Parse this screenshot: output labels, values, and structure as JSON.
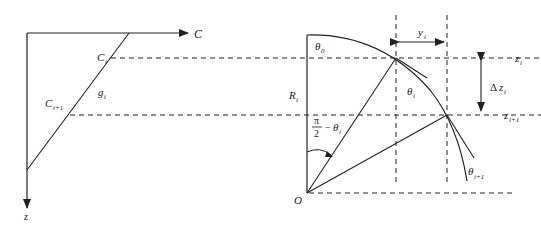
{
  "left_panel": {
    "axis_horizontal_label": "C",
    "axis_vertical_label": "z",
    "point_upper": {
      "main": "C",
      "sub": "i"
    },
    "point_lower": {
      "main": "C",
      "sub": "i+1"
    },
    "gradient_label": {
      "main": "g",
      "sub": "i"
    }
  },
  "right_panel": {
    "origin_label": "O",
    "initial_angle": {
      "main": "θ",
      "sub": "0"
    },
    "radius_label": {
      "main": "R",
      "sub": "i"
    },
    "angle_fraction": {
      "numerator": "π",
      "denominator": "2",
      "minus": "−",
      "theta": "θ",
      "sub": "i"
    },
    "theta_i": {
      "main": "θ",
      "sub": "i"
    },
    "theta_i1": {
      "main": "θ",
      "sub": "i+1"
    },
    "horizontal_offset": {
      "main": "y",
      "sub": "i"
    },
    "depth_step": {
      "delta": "Δ",
      "main": "z",
      "sub": "i"
    },
    "depth_upper": {
      "main": "z",
      "sub": "i"
    },
    "depth_lower": {
      "main": "z",
      "sub": "i+1"
    }
  },
  "colors": {
    "stroke": "#222222",
    "background": "#ffffff"
  }
}
